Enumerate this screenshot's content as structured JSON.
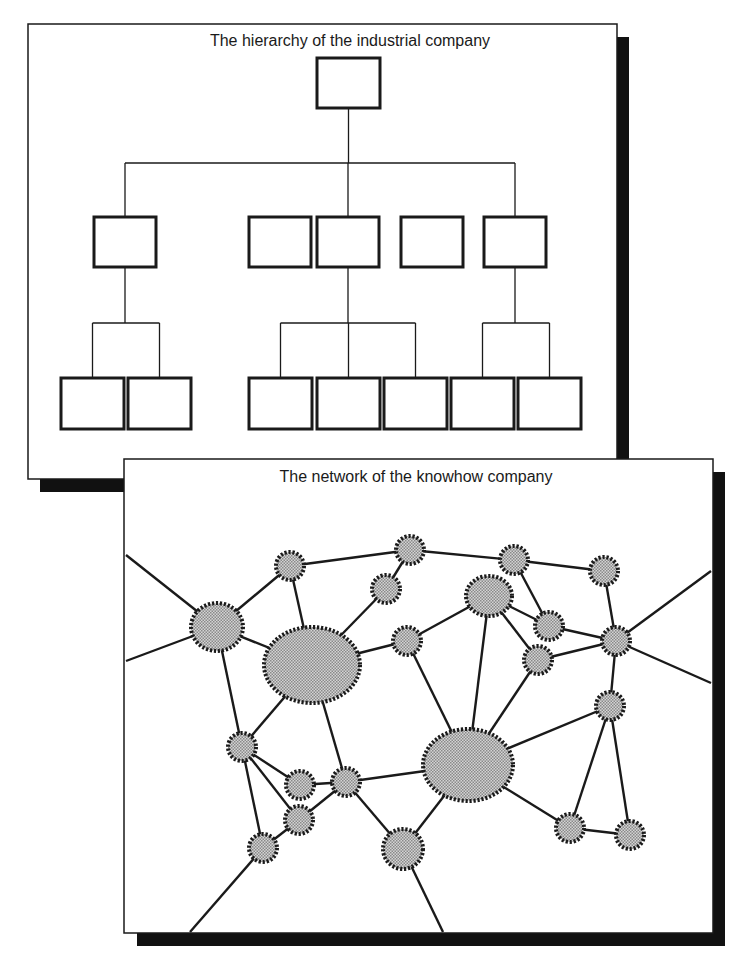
{
  "colors": {
    "ink": "#1a1a1a",
    "shadow": "#111111",
    "node_fill": "#b8b8b8",
    "background": "#ffffff"
  },
  "hierarchy": {
    "title": "The hierarchy of the industrial company",
    "panel": {
      "x": 28,
      "y": 24,
      "w": 240,
      "h": 454
    },
    "root": {
      "x": 317,
      "y": 58,
      "w": 63,
      "h": 50
    },
    "level1": [
      {
        "x": 94,
        "y": 217,
        "w": 62,
        "h": 50
      },
      {
        "x": 249,
        "y": 217,
        "w": 62,
        "h": 50
      },
      {
        "x": 317,
        "y": 217,
        "w": 62,
        "h": 50
      },
      {
        "x": 401,
        "y": 217,
        "w": 62,
        "h": 50
      },
      {
        "x": 484,
        "y": 217,
        "w": 62,
        "h": 50
      }
    ],
    "level2": [
      {
        "x": 61,
        "y": 378,
        "w": 63,
        "h": 51
      },
      {
        "x": 128,
        "y": 378,
        "w": 63,
        "h": 51
      },
      {
        "x": 249,
        "y": 378,
        "w": 63,
        "h": 51
      },
      {
        "x": 317,
        "y": 378,
        "w": 63,
        "h": 51
      },
      {
        "x": 384,
        "y": 378,
        "w": 63,
        "h": 51
      },
      {
        "x": 451,
        "y": 378,
        "w": 63,
        "h": 51
      },
      {
        "x": 518,
        "y": 378,
        "w": 63,
        "h": 51
      }
    ]
  },
  "network": {
    "title": "The network of the knowhow company",
    "nodes": [
      {
        "id": "n1",
        "cx": 217,
        "cy": 627,
        "rx": 26,
        "ry": 24
      },
      {
        "id": "n2",
        "cx": 312,
        "cy": 665,
        "rx": 48,
        "ry": 38
      },
      {
        "id": "n3",
        "cx": 290,
        "cy": 566,
        "rx": 14,
        "ry": 14
      },
      {
        "id": "n4",
        "cx": 410,
        "cy": 550,
        "rx": 14,
        "ry": 14
      },
      {
        "id": "n5",
        "cx": 386,
        "cy": 589,
        "rx": 14,
        "ry": 14
      },
      {
        "id": "n6",
        "cx": 407,
        "cy": 641,
        "rx": 14,
        "ry": 14
      },
      {
        "id": "n7",
        "cx": 514,
        "cy": 560,
        "rx": 14,
        "ry": 14
      },
      {
        "id": "n8",
        "cx": 489,
        "cy": 596,
        "rx": 23,
        "ry": 20
      },
      {
        "id": "n9",
        "cx": 604,
        "cy": 571,
        "rx": 14,
        "ry": 14
      },
      {
        "id": "n10",
        "cx": 549,
        "cy": 626,
        "rx": 14,
        "ry": 14
      },
      {
        "id": "n11",
        "cx": 538,
        "cy": 660,
        "rx": 14,
        "ry": 14
      },
      {
        "id": "n12",
        "cx": 616,
        "cy": 641,
        "rx": 14,
        "ry": 14
      },
      {
        "id": "n13",
        "cx": 242,
        "cy": 747,
        "rx": 14,
        "ry": 14
      },
      {
        "id": "n14",
        "cx": 300,
        "cy": 785,
        "rx": 14,
        "ry": 14
      },
      {
        "id": "n15",
        "cx": 346,
        "cy": 782,
        "rx": 14,
        "ry": 14
      },
      {
        "id": "n16",
        "cx": 299,
        "cy": 820,
        "rx": 14,
        "ry": 14
      },
      {
        "id": "n17",
        "cx": 263,
        "cy": 848,
        "rx": 14,
        "ry": 14
      },
      {
        "id": "n18",
        "cx": 468,
        "cy": 765,
        "rx": 45,
        "ry": 36
      },
      {
        "id": "n19",
        "cx": 610,
        "cy": 706,
        "rx": 14,
        "ry": 14
      },
      {
        "id": "n20",
        "cx": 403,
        "cy": 849,
        "rx": 20,
        "ry": 20
      },
      {
        "id": "n21",
        "cx": 570,
        "cy": 828,
        "rx": 14,
        "ry": 14
      },
      {
        "id": "n22",
        "cx": 630,
        "cy": 835,
        "rx": 14,
        "ry": 14
      }
    ],
    "edges": [
      [
        "n1",
        "n3"
      ],
      [
        "n1",
        "n2"
      ],
      [
        "n3",
        "n2"
      ],
      [
        "n3",
        "n4"
      ],
      [
        "n4",
        "n5"
      ],
      [
        "n5",
        "n2"
      ],
      [
        "n4",
        "n7"
      ],
      [
        "n7",
        "n9"
      ],
      [
        "n7",
        "n10"
      ],
      [
        "n8",
        "n10"
      ],
      [
        "n8",
        "n11"
      ],
      [
        "n10",
        "n12"
      ],
      [
        "n11",
        "n12"
      ],
      [
        "n9",
        "n12"
      ],
      [
        "n2",
        "n6"
      ],
      [
        "n6",
        "n18"
      ],
      [
        "n8",
        "n6"
      ],
      [
        "n8",
        "n18"
      ],
      [
        "n12",
        "n19"
      ],
      [
        "n11",
        "n18"
      ],
      [
        "n1",
        "n13"
      ],
      [
        "n2",
        "n13"
      ],
      [
        "n2",
        "n15"
      ],
      [
        "n13",
        "n14"
      ],
      [
        "n13",
        "n16"
      ],
      [
        "n13",
        "n17"
      ],
      [
        "n14",
        "n15"
      ],
      [
        "n15",
        "n16"
      ],
      [
        "n16",
        "n17"
      ],
      [
        "n15",
        "n18"
      ],
      [
        "n15",
        "n20"
      ],
      [
        "n18",
        "n20"
      ],
      [
        "n18",
        "n19"
      ],
      [
        "n18",
        "n21"
      ],
      [
        "n19",
        "n21"
      ],
      [
        "n19",
        "n22"
      ],
      [
        "n21",
        "n22"
      ]
    ],
    "boundary_edges": [
      {
        "from": "n1",
        "x": 126,
        "y": 555
      },
      {
        "from": "n1",
        "x": 126,
        "y": 661
      },
      {
        "from": "n12",
        "x": 711,
        "y": 571
      },
      {
        "from": "n12",
        "x": 711,
        "y": 683
      },
      {
        "from": "n17",
        "x": 190,
        "y": 932
      },
      {
        "from": "n20",
        "x": 443,
        "y": 932
      }
    ]
  }
}
